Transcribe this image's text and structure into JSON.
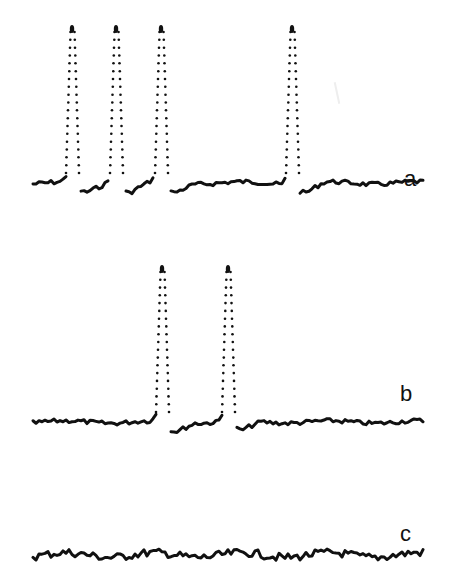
{
  "chart_data": {
    "type": "line",
    "title": "",
    "xlabel": "",
    "ylabel": "",
    "grid": false,
    "legend": "none",
    "ink_color": "#111111",
    "series": [
      {
        "name": "a",
        "label": "a",
        "baseline_y": 183,
        "peak_top_y": 26,
        "peaks_x": [
          72,
          116,
          161,
          292
        ],
        "peak_count": 4,
        "x_range": [
          33,
          425
        ],
        "label_pos": [
          404,
          168
        ]
      },
      {
        "name": "b",
        "label": "b",
        "baseline_y": 422,
        "peak_top_y": 266,
        "peaks_x": [
          162,
          228
        ],
        "peak_count": 2,
        "x_range": [
          33,
          424
        ],
        "label_pos": [
          400,
          383
        ]
      },
      {
        "name": "c",
        "label": "c",
        "baseline_y": 555,
        "peak_top_y": null,
        "peaks_x": [],
        "peak_count": 0,
        "x_range": [
          33,
          424
        ],
        "label_pos": [
          400,
          523
        ]
      }
    ]
  }
}
